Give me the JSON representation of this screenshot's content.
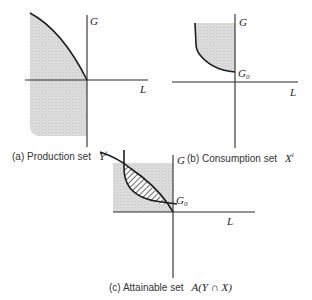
{
  "colors": {
    "shade": "#d9d9d9",
    "hatch": "#2a2a2a",
    "line": "#1e1e1e"
  },
  "panels": [
    {
      "id": "a",
      "axis_labels": {
        "vertical": "G",
        "horizontal": "L"
      },
      "caption_prefix": "(a)  Production  set",
      "caption_symbol": "Y",
      "caption_superscript": "j"
    },
    {
      "id": "b",
      "axis_labels": {
        "vertical": "G",
        "horizontal": "L"
      },
      "point_label": "G",
      "point_label_sub": "0",
      "caption_prefix": "(b)  Consumption  set",
      "caption_symbol": "X",
      "caption_superscript": "i"
    },
    {
      "id": "c",
      "axis_labels": {
        "vertical": "G",
        "horizontal": "L"
      },
      "point_label": "G",
      "point_label_sub": "0",
      "caption_prefix": "(c)  Attainable  set",
      "caption_symbol": "A(Y ∩ X)"
    }
  ]
}
